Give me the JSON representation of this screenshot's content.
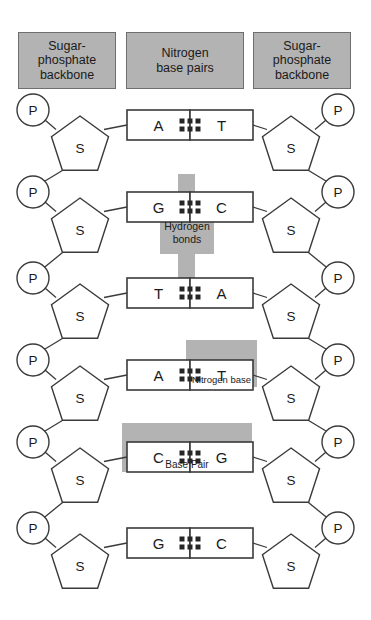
{
  "diagram": {
    "colors": {
      "gray_fill": "#b3b3b3",
      "gray_band": "#b3b3b3",
      "outline": "#3a3a3a",
      "header_border": "#6e6e6e",
      "text": "#1a1a1a",
      "background": "#ffffff"
    }
  },
  "headers": [
    {
      "id": "left-backbone",
      "lines": [
        "Sugar-",
        "phosphate",
        "backbone"
      ],
      "x": 18,
      "y": 32,
      "w": 98,
      "h": 57
    },
    {
      "id": "base-pairs",
      "lines": [
        "Nitrogen",
        "base pairs"
      ],
      "x": 126,
      "y": 32,
      "w": 118,
      "h": 57
    },
    {
      "id": "right-backbone",
      "lines": [
        "Sugar-",
        "phosphate",
        "backbone"
      ],
      "x": 253,
      "y": 32,
      "w": 98,
      "h": 57
    }
  ],
  "backbone": {
    "phosphate_label": "P",
    "sugar_label": "S",
    "left_phosphate_x": 33,
    "right_phosphate_x": 338,
    "left_sugar_x": 80,
    "right_sugar_x": 291,
    "phosphate_radius": 16,
    "sugar_radius": 30
  },
  "rows": [
    {
      "index": 0,
      "y": 110,
      "left_base": "A",
      "right_base": "T",
      "bonds": 2
    },
    {
      "index": 1,
      "y": 192,
      "left_base": "G",
      "right_base": "C",
      "bonds": 3
    },
    {
      "index": 2,
      "y": 278,
      "left_base": "T",
      "right_base": "A",
      "bonds": 2
    },
    {
      "index": 3,
      "y": 360,
      "left_base": "A",
      "right_base": "T",
      "bonds": 2
    },
    {
      "index": 4,
      "y": 442,
      "left_base": "C",
      "right_base": "G",
      "bonds": 3
    },
    {
      "index": 5,
      "y": 528,
      "left_base": "G",
      "right_base": "C",
      "bonds": 3
    }
  ],
  "annotations": [
    {
      "id": "hydrogen-bonds",
      "label": "Hydrogen bonds",
      "label_lines": [
        "Hydrogen",
        "bonds"
      ],
      "band": {
        "x": 178,
        "y": 174,
        "w": 17,
        "h": 122
      },
      "plate": {
        "x": 160,
        "y": 212,
        "w": 54,
        "h": 42
      }
    },
    {
      "id": "nitrogen-base",
      "label": "Nitrogen base",
      "label_lines": [
        "Nitrogen base"
      ],
      "plate": {
        "x": 186,
        "y": 340,
        "w": 71,
        "h": 47
      }
    },
    {
      "id": "base-pair",
      "label": "Base Pair",
      "label_lines": [
        "Base Pair"
      ],
      "plate": {
        "x": 122,
        "y": 423,
        "w": 130,
        "h": 49
      }
    }
  ],
  "base_box": {
    "w": 63,
    "h": 30,
    "left_x": 127,
    "right_x": 190
  }
}
